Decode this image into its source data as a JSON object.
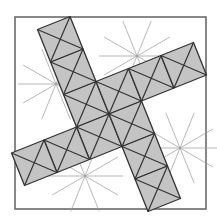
{
  "figure": {
    "frame": {
      "x": 15,
      "y": 17,
      "width": 191,
      "height": 192
    },
    "colors": {
      "fill": "#c4c4c4",
      "edge": "#333333",
      "guide": "#9a9a9a",
      "frame": "#6b6b6b"
    },
    "lattice": {
      "origin": [
        109,
        114
      ],
      "a": [
        32.5,
        -13
      ],
      "b": [
        13,
        32.5
      ]
    },
    "cells": [
      [
        -1,
        -1
      ],
      [
        0,
        -1
      ],
      [
        -1,
        0
      ],
      [
        0,
        0
      ],
      [
        -1,
        -2
      ],
      [
        -1,
        -3
      ],
      [
        1,
        -1
      ],
      [
        2,
        -1
      ],
      [
        0,
        1
      ],
      [
        0,
        2
      ],
      [
        -2,
        0
      ],
      [
        -3,
        0
      ]
    ],
    "guide_centers": [
      [
        56,
        84
      ],
      [
        137,
        56
      ],
      [
        180,
        148
      ],
      [
        85,
        176
      ]
    ]
  }
}
